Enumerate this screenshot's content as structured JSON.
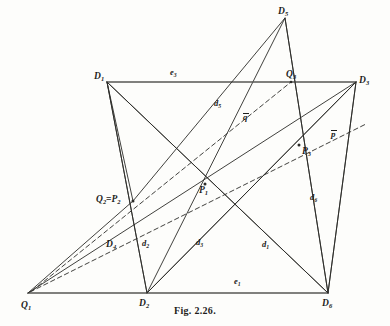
{
  "figure": {
    "caption": "Fig. 2.26.",
    "width": 390,
    "height": 326,
    "background_color": "#fdfdfb",
    "line_color": "#2b2b28",
    "label_color": "#1d1d1b"
  },
  "points": {
    "D1": {
      "label": "D",
      "sub": "1",
      "x": 107,
      "y": 82,
      "label_x": 94,
      "label_y": 72
    },
    "D2": {
      "label": "D",
      "sub": "2",
      "x": 147,
      "y": 293,
      "label_x": 139,
      "label_y": 299
    },
    "D3": {
      "label": "D",
      "sub": "3",
      "x": 356,
      "y": 82,
      "label_x": 359,
      "label_y": 76
    },
    "D4": {
      "label": "D",
      "sub": "4",
      "x": 113,
      "y": 242,
      "label_x": 106,
      "label_y": 240
    },
    "D5": {
      "label": "D",
      "sub": "5",
      "x": 285,
      "y": 18,
      "label_x": 278,
      "label_y": 7
    },
    "D6": {
      "label": "D",
      "sub": "6",
      "x": 328,
      "y": 293,
      "label_x": 322,
      "label_y": 299
    },
    "Q1": {
      "label": "Q",
      "sub": "1",
      "x": 28,
      "y": 293,
      "label_x": 21,
      "label_y": 301
    },
    "Q2P2": {
      "label": "Q",
      "sub": "2",
      "label2": "P",
      "sub2": "2",
      "sep": "=",
      "x": 133,
      "y": 201,
      "label_x": 96,
      "label_y": 195
    },
    "Q3": {
      "label": "Q",
      "sub": "3",
      "x": 291,
      "y": 82,
      "label_x": 286,
      "label_y": 70
    },
    "P1": {
      "label": "P",
      "sub": "1",
      "x": 205,
      "y": 184,
      "label_x": 199,
      "label_y": 186
    },
    "P3": {
      "label": "P",
      "sub": "3",
      "x": 299,
      "y": 145,
      "label_x": 302,
      "label_y": 147
    }
  },
  "edge_labels": [
    {
      "name": "e3",
      "label": "e",
      "sub": "3",
      "x": 170,
      "y": 68
    },
    {
      "name": "e1",
      "label": "e",
      "sub": "1",
      "x": 234,
      "y": 277
    },
    {
      "name": "d5",
      "label": "d",
      "sub": "5",
      "x": 214,
      "y": 99
    },
    {
      "name": "d6",
      "label": "d",
      "sub": "6",
      "x": 310,
      "y": 193
    },
    {
      "name": "d1",
      "label": "d",
      "sub": "1",
      "x": 262,
      "y": 240
    },
    {
      "name": "d2",
      "label": "d",
      "sub": "2",
      "x": 142,
      "y": 239
    },
    {
      "name": "d3",
      "label": "d",
      "sub": "3",
      "x": 196,
      "y": 238
    }
  ],
  "projective_lines": [
    {
      "name": "q-bar",
      "label": "q",
      "overline": true,
      "x": 243,
      "y": 113
    },
    {
      "name": "p-bar",
      "label": "p",
      "overline": true,
      "x": 331,
      "y": 130
    }
  ],
  "chart_data": {
    "type": "diagram",
    "title": "Fig. 2.26.",
    "vertices": [
      {
        "id": "D1",
        "x": 107,
        "y": 82
      },
      {
        "id": "D2",
        "x": 147,
        "y": 293
      },
      {
        "id": "D3",
        "x": 356,
        "y": 82
      },
      {
        "id": "D4",
        "x": 113,
        "y": 242
      },
      {
        "id": "D5",
        "x": 285,
        "y": 18
      },
      {
        "id": "D6",
        "x": 328,
        "y": 293
      },
      {
        "id": "Q1",
        "x": 28,
        "y": 293
      },
      {
        "id": "Q2P2",
        "x": 133,
        "y": 201
      },
      {
        "id": "Q3",
        "x": 291,
        "y": 82
      },
      {
        "id": "P1",
        "x": 205,
        "y": 184
      },
      {
        "id": "P3",
        "x": 299,
        "y": 145
      }
    ],
    "segments": [
      {
        "name": "e3",
        "from": "D1",
        "to": "D3",
        "style": "solid",
        "thick": true
      },
      {
        "name": "e1",
        "from": "Q1",
        "to": "D6",
        "style": "solid",
        "thick": true
      },
      {
        "name": "d5",
        "from": "Q2P2",
        "to": "D5",
        "style": "solid"
      },
      {
        "name": "d2",
        "from": "D1",
        "to": "D2",
        "style": "solid"
      },
      {
        "name": "d6",
        "from": "D3",
        "to": "D6",
        "style": "solid"
      },
      {
        "name": "d1",
        "from": "D2",
        "to": "D6x",
        "style": "solid"
      },
      {
        "name": "d3",
        "from": "D2",
        "to": "D3",
        "style": "solid"
      },
      {
        "name": "d4",
        "from": "D1",
        "to": "D6",
        "style": "solid"
      },
      {
        "name": "d5b",
        "from": "D5",
        "to": "D6",
        "style": "solid"
      },
      {
        "name": "q-bar",
        "from": "Q1",
        "to": "Q3",
        "style": "dashed"
      },
      {
        "name": "p-bar",
        "from": "Q2P2",
        "to": "P3",
        "style": "dashed"
      }
    ]
  }
}
